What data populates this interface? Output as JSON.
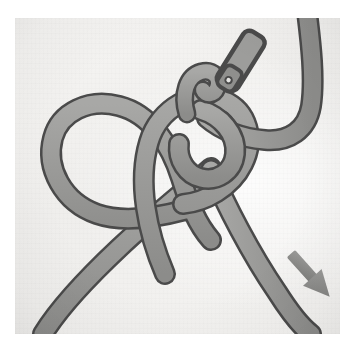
{
  "image": {
    "kind": "instructional-illustration",
    "subject": "cord-knot-tying-step",
    "background_color": "#f3f2f0",
    "page_color": "#ffffff",
    "frame": {
      "x": 15,
      "y": 18,
      "width": 325,
      "height": 316
    }
  },
  "palette": {
    "rope_fill": "#9b9b9b",
    "rope_fill_light": "#b0b0ae",
    "rope_fill_shadow": "#8a8a88",
    "rope_outline": "#4a4a4a",
    "arrow_color": "#8f8f8d",
    "arrow_outline": "#6e6e6c",
    "tip_fill": "#9d9d9b",
    "tip_outline": "#4a4a4a",
    "highlight": "#e9e8e6"
  },
  "elements": {
    "rope_label": "cord",
    "loop_label": "left loop",
    "knot_label": "overhand knot crossing",
    "working_end_label": "working end",
    "standing_part_label": "standing part",
    "tip_label": "cord tip (aglet)",
    "hook_label": "small hook bend",
    "arrow_label": "pull direction arrow"
  },
  "arrow": {
    "name": "pull-direction-arrow",
    "direction": "down-right",
    "x": 293,
    "y": 252,
    "length": 48,
    "angle_degrees": 48,
    "color": "#8f8f8d"
  },
  "annotations": {
    "title": "",
    "step_number": "",
    "caption": ""
  }
}
